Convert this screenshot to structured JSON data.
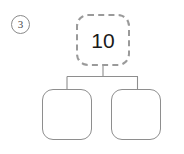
{
  "worksheet": {
    "problem_number": "3",
    "number_bond": {
      "whole": {
        "value": "10",
        "border_style": "dashed",
        "border_color": "#9a9a9a"
      },
      "parts": [
        {
          "value": "",
          "border_style": "solid",
          "border_color": "#8e8e8e"
        },
        {
          "value": "",
          "border_style": "solid",
          "border_color": "#8e8e8e"
        }
      ]
    },
    "connector_color": "#8e8e8e",
    "background_color": "#ffffff"
  }
}
